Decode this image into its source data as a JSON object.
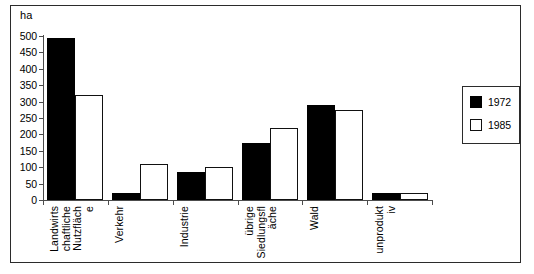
{
  "figure": {
    "unit_label": "ha"
  },
  "legend": {
    "position": "right",
    "entries": [
      {
        "label": "1972",
        "swatch": "filled-black-square-icon",
        "color": "#000000"
      },
      {
        "label": "1985",
        "swatch": "hollow-white-square-icon",
        "color": "#ffffff"
      }
    ]
  },
  "axis": {
    "y_ticks": [
      "500",
      "450",
      "400",
      "350",
      "300",
      "250",
      "200",
      "150",
      "100",
      "50",
      "0"
    ]
  },
  "categories": [
    {
      "lines": [
        "Landwirts",
        "chaftliche",
        "Nutzfläch",
        "e"
      ]
    },
    {
      "lines": [
        "Verkehr"
      ]
    },
    {
      "lines": [
        "Industrie"
      ]
    },
    {
      "lines": [
        "übrige",
        "Siedlungsfl",
        "äche"
      ]
    },
    {
      "lines": [
        "Wald"
      ]
    },
    {
      "lines": [
        "unprodukt",
        "iv"
      ]
    }
  ],
  "chart_data": {
    "type": "bar",
    "title": "",
    "subtitle": "",
    "xlabel": "",
    "ylabel": "ha",
    "ylim": [
      0,
      500
    ],
    "ytick_step": 50,
    "grid": false,
    "legend_position": "right",
    "categories": [
      "Landwirtschaftliche Nutzfläche",
      "Verkehr",
      "Industrie",
      "übrige Siedlungsfläche",
      "Wald",
      "unproduktiv"
    ],
    "series": [
      {
        "name": "1972",
        "color": "#000000",
        "values": [
          495,
          20,
          85,
          175,
          290,
          20
        ]
      },
      {
        "name": "1985",
        "color": "#ffffff",
        "values": [
          320,
          110,
          100,
          220,
          275,
          20
        ]
      }
    ]
  }
}
